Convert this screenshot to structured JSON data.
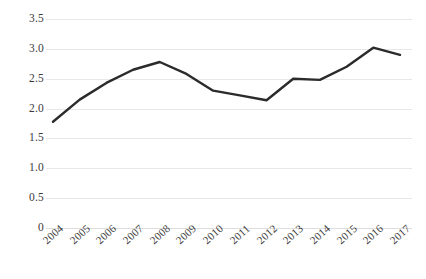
{
  "chart_data": {
    "type": "line",
    "title": "",
    "subtitle": "",
    "xlabel": "",
    "ylabel": "",
    "categories": [
      "2004",
      "2005",
      "2006",
      "2007",
      "2008",
      "2009",
      "2010",
      "2011",
      "2012",
      "2013",
      "2014",
      "2015",
      "2016",
      "2017"
    ],
    "values": [
      1.78,
      2.15,
      2.43,
      2.65,
      2.78,
      2.58,
      2.3,
      2.22,
      2.14,
      2.5,
      2.48,
      2.7,
      3.02,
      2.9
    ],
    "series": [
      {
        "name": "",
        "values": [
          1.78,
          2.15,
          2.43,
          2.65,
          2.78,
          2.58,
          2.3,
          2.22,
          2.14,
          2.5,
          2.48,
          2.7,
          3.02,
          2.9
        ],
        "color": "#2b2b2b"
      }
    ],
    "ylim": [
      0,
      3.5
    ],
    "yticks": [
      0,
      0.5,
      1.0,
      1.5,
      2.0,
      2.5,
      3.0,
      3.5
    ],
    "ytick_labels": [
      "0",
      "0.5",
      "1.0",
      "1.5",
      "2.0",
      "2.5",
      "3.0",
      "3.5"
    ],
    "xtick_labels": [
      "2004",
      "2005",
      "2006",
      "2007",
      "2008",
      "2009",
      "2010",
      "2011",
      "2012",
      "2013",
      "2014",
      "2015",
      "2016",
      "2017"
    ],
    "grid": "horizontal",
    "grid_color": "#e8e8e8",
    "legend": "none",
    "legend_position": "none",
    "markers": "none",
    "line_width": 2.4,
    "background": "#ffffff",
    "annotations": []
  }
}
